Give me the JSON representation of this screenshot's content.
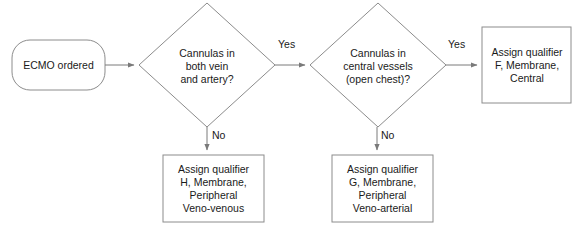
{
  "diagram": {
    "type": "flowchart",
    "background_color": "#ffffff",
    "line_color": "#808080",
    "text_color": "#1a1a1a",
    "nodes": {
      "start": {
        "shape": "rounded-rectangle",
        "text": "ECMO ordered"
      },
      "decision_1": {
        "shape": "diamond",
        "text": "Cannulas in\nboth vein\nand artery?"
      },
      "decision_2": {
        "shape": "diamond",
        "text": "Cannulas in\ncentral vessels\n(open chest)?"
      },
      "outcome_central": {
        "shape": "rectangle",
        "text": "Assign qualifier\nF, Membrane,\nCentral"
      },
      "outcome_venovenous": {
        "shape": "rectangle",
        "text": "Assign qualifier\nH, Membrane,\nPeripheral\nVeno-venous"
      },
      "outcome_venoarterial": {
        "shape": "rectangle",
        "text": "Assign qualifier\nG, Membrane,\nPeripheral\nVeno-arterial"
      }
    },
    "edges": {
      "yes_1": "Yes",
      "yes_2": "Yes",
      "no_1": "No",
      "no_2": "No"
    }
  }
}
